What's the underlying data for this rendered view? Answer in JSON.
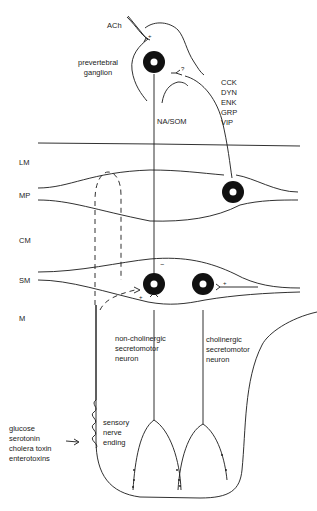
{
  "diagram": {
    "colors": {
      "ink": "#1a1a1a",
      "background": "#ffffff"
    },
    "top": {
      "transmitter": "ACh",
      "ganglion_label": [
        "prevertebral",
        "ganglion"
      ],
      "pathway_label": "NA/SOM",
      "peptides": [
        "CCK",
        "DYN",
        "ENK",
        "GRP",
        "VIP"
      ],
      "synapse_signs": {
        "ach": "+",
        "unknown": "?"
      }
    },
    "layers": [
      "LM",
      "MP",
      "CM",
      "SM",
      "M"
    ],
    "neurons": {
      "non_cholinergic": [
        "non-cholinergic",
        "secretomotor",
        "neuron"
      ],
      "cholinergic": [
        "cholinergic",
        "secretomotor",
        "neuron"
      ]
    },
    "synapse_signs": {
      "na_som": "−",
      "sensory": "+",
      "cholinergic_input": "+"
    },
    "sensory": [
      "sensory",
      "nerve",
      "ending"
    ],
    "stimuli": [
      "glucose",
      "serotonin",
      "cholera toxin",
      "enterotoxins"
    ]
  }
}
